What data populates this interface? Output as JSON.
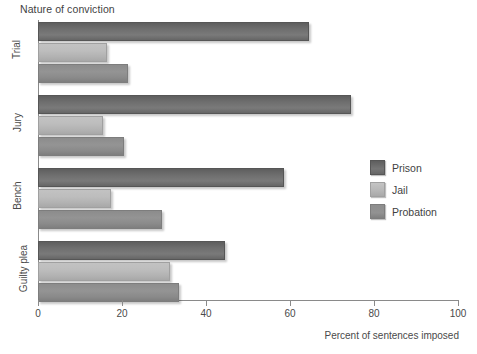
{
  "chart_data": {
    "type": "bar",
    "orientation": "horizontal",
    "title": "Nature of conviction",
    "xlabel": "Percent of sentences imposed",
    "ylabel": "",
    "xlim": [
      0,
      100
    ],
    "xticks": [
      0,
      20,
      40,
      60,
      80,
      100
    ],
    "xtick_labels": [
      "0",
      "20",
      "40",
      "60",
      "80",
      "100"
    ],
    "grid": false,
    "legend_position": "right-middle",
    "categories": [
      "Trial",
      "Jury",
      "Bench",
      "Guilty plea"
    ],
    "series": [
      {
        "name": "Prison",
        "color": "#6e6e6e",
        "values": [
          64,
          74,
          58,
          44
        ]
      },
      {
        "name": "Jail",
        "color": "#b8b8b8",
        "values": [
          16,
          15,
          17,
          31
        ]
      },
      {
        "name": "Probation",
        "color": "#8e8e8e",
        "values": [
          21,
          20,
          29,
          33
        ]
      }
    ]
  },
  "legend": {
    "items": [
      {
        "label": "Prison",
        "swatch": "prison"
      },
      {
        "label": "Jail",
        "swatch": "jail"
      },
      {
        "label": "Probation",
        "swatch": "probation"
      }
    ]
  }
}
